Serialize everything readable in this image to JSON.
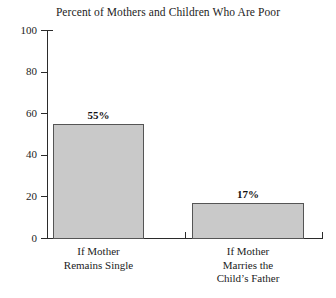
{
  "chart_data": {
    "type": "bar",
    "title": "Percent of Mothers and Children Who Are Poor",
    "xlabel": "",
    "ylabel": "",
    "categories": [
      "If Mother Remains Single",
      "If Mother Marries the Child's Father"
    ],
    "category_lines": [
      [
        "If Mother",
        "Remains Single"
      ],
      [
        "If Mother",
        "Marries the",
        "Child’s Father"
      ]
    ],
    "values": [
      55,
      17
    ],
    "value_labels": [
      "55%",
      "17%"
    ],
    "ylim": [
      0,
      100
    ],
    "yticks": [
      0,
      20,
      40,
      60,
      80,
      100
    ],
    "ytick_labels": [
      "0",
      "20",
      "40",
      "60",
      "80",
      "100"
    ],
    "grid": false,
    "legend": false,
    "bar_fill_color": "#c9c9c9",
    "bar_edge_color": "#555555",
    "axis_color": "#2b2b2b",
    "background_color": "#ffffff",
    "text_color": "#1c1c1c"
  }
}
